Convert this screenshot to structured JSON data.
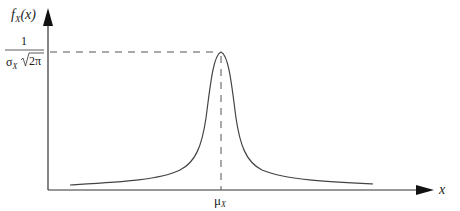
{
  "diagram": {
    "type": "probability-density-curve",
    "y_axis": {
      "label_main": "f",
      "label_sub": "X",
      "label_arg": "(x)"
    },
    "x_axis": {
      "label": "x"
    },
    "peak_label": {
      "numerator": "1",
      "denominator_sigma": "σ",
      "denominator_sub": "X",
      "denominator_root": "2π"
    },
    "mean_label": {
      "main": "μ",
      "sub": "X"
    },
    "colors": {
      "axis": "#333333",
      "curve": "#444444",
      "dashed": "#555555"
    }
  }
}
